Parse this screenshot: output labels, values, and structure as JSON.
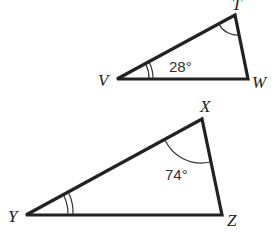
{
  "figure": {
    "triangles": [
      {
        "name": "TVW",
        "vertices": {
          "T": "T",
          "V": "V",
          "W": "W"
        },
        "angle_label": "28°",
        "angle_at": "V",
        "marks": {
          "V": "double arc",
          "T": "single arc"
        }
      },
      {
        "name": "XYZ",
        "vertices": {
          "X": "X",
          "Y": "Y",
          "Z": "Z"
        },
        "angle_label": "74°",
        "angle_at": "X",
        "marks": {
          "Y": "double arc",
          "X": "single arc"
        }
      }
    ]
  }
}
